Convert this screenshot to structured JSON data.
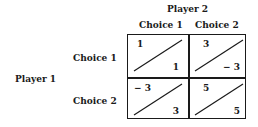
{
  "player2": {
    "label": "Player 2",
    "choices": [
      "Choice 1",
      "Choice 2"
    ]
  },
  "player1": {
    "label": "Player 1",
    "choices": [
      "Choice 1",
      "Choice 2"
    ]
  },
  "payoffs": [
    [
      {
        "p1": "1",
        "p2": "1"
      },
      {
        "p1": "3",
        "p2": "− 3"
      }
    ],
    [
      {
        "p1": "− 3",
        "p2": "3"
      },
      {
        "p1": "5",
        "p2": "5"
      }
    ]
  ]
}
